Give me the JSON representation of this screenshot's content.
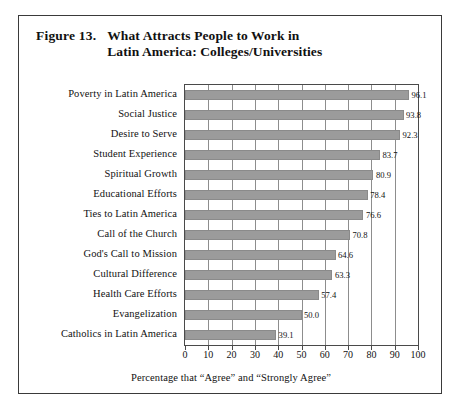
{
  "figure": {
    "number_label": "Figure 13.",
    "title_line1": "What Attracts People to Work in",
    "title_line2": "Latin America: Colleges/Universities"
  },
  "chart_data": {
    "type": "bar",
    "orientation": "horizontal",
    "title": "Figure 13. What Attracts People to Work in Latin America: Colleges/Universities",
    "xlabel": "Percentage that “Agree” and “Strongly Agree”",
    "ylabel": "",
    "xlim": [
      0,
      100
    ],
    "xticks": [
      0,
      10,
      20,
      30,
      40,
      50,
      60,
      70,
      80,
      90,
      100
    ],
    "xtick_labels": [
      "0",
      "10",
      "20",
      "30",
      "40",
      "50",
      "60",
      "70",
      "80",
      "90",
      "100"
    ],
    "grid": "vertical",
    "legend": "none",
    "bar_color": "#9b9b9b",
    "categories": [
      "Poverty in Latin America",
      "Social Justice",
      "Desire to Serve",
      "Student Experience",
      "Spiritual Growth",
      "Educational Efforts",
      "Ties to Latin America",
      "Call of the Church",
      "God's Call to Mission",
      "Cultural Difference",
      "Health Care Efforts",
      "Evangelization",
      "Catholics in Latin America"
    ],
    "values": [
      96.1,
      93.8,
      92.3,
      83.7,
      80.9,
      78.4,
      76.6,
      70.8,
      64.6,
      63.3,
      57.4,
      50.0,
      39.1
    ],
    "value_labels": [
      "96.1",
      "93.8",
      "92.3",
      "83.7",
      "80.9",
      "78.4",
      "76.6",
      "70.8",
      "64.6",
      "63.3",
      "57.4",
      "50.0",
      "39.1"
    ]
  }
}
